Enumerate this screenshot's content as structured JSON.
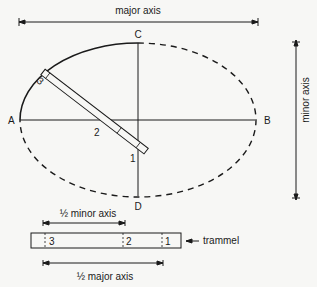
{
  "diagram": {
    "type": "trammel-method ellipse construction",
    "labels": {
      "major_axis": "major axis",
      "minor_axis": "minor axis",
      "half_minor_axis": "½ minor axis",
      "half_major_axis": "½ major axis",
      "trammel": "trammel"
    },
    "points": {
      "A": "A",
      "B": "B",
      "C": "C",
      "D": "D"
    },
    "trammel_marks": {
      "one": "1",
      "two": "2",
      "three": "3"
    },
    "colors": {
      "ink": "#1a1a1a",
      "paper": "#f7f7f5"
    }
  }
}
